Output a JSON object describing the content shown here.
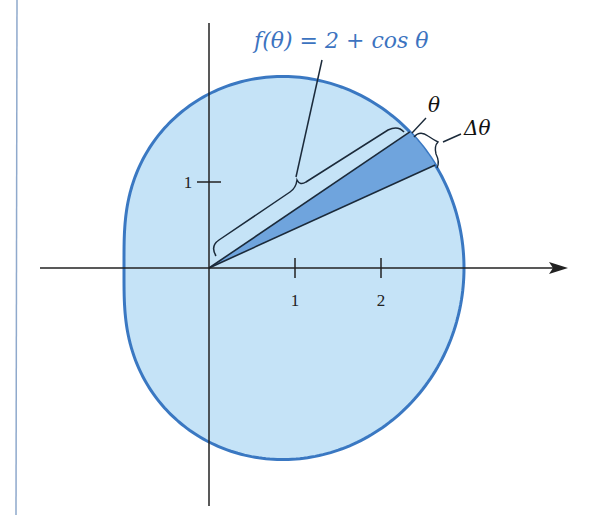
{
  "figure": {
    "function_label": "f(θ) = 2 + cos θ",
    "function_label_parts": {
      "f": "f",
      "open": "(",
      "theta": "θ",
      "close": ")",
      "rest": " = 2 + cos ",
      "theta2": "θ"
    },
    "angle_label": "θ",
    "delta_angle_label": "Δθ",
    "x_ticks": [
      {
        "value": 1,
        "label": "1"
      },
      {
        "value": 2,
        "label": "2"
      }
    ],
    "y_ticks": [
      {
        "value": 1,
        "label": "1"
      }
    ],
    "colors": {
      "region_fill": "#c5e3f7",
      "curve_stroke": "#3a78c2",
      "wedge_fill": "#6fa4dd",
      "label_blue": "#3c73c0",
      "axis": "#222222",
      "margin_rule": "#8fa9cc"
    }
  },
  "chart_data": {
    "type": "polar-curve",
    "title": "",
    "curve": "r = 2 + cos θ",
    "annotations": [
      "f(θ) = 2 + cos θ",
      "θ",
      "Δθ"
    ],
    "x_ticks": [
      1,
      2
    ],
    "y_ticks": [
      1
    ],
    "wedge": {
      "theta_deg": 24,
      "delta_theta_deg": 9.5
    },
    "x_range": [
      -1,
      3
    ],
    "y_range": [
      -2.2,
      2.2
    ]
  }
}
